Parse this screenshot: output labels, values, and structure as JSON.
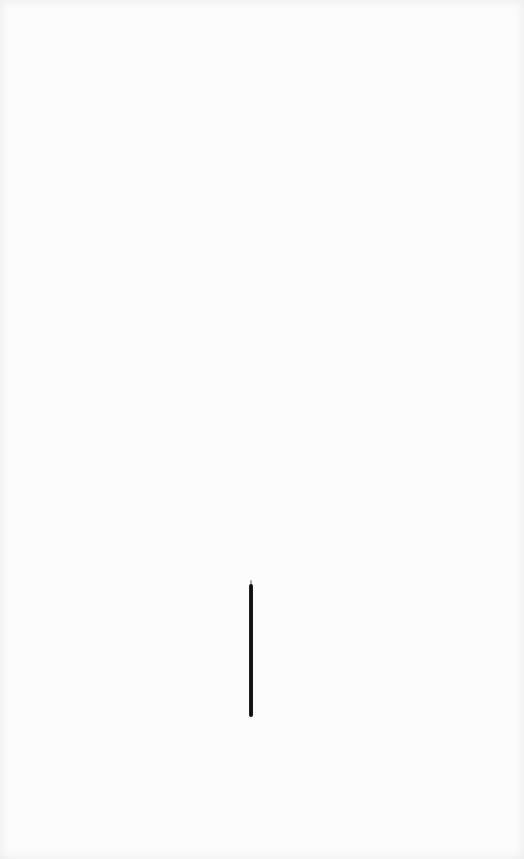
{
  "canvas": {
    "background_color": "#fcfcfc",
    "ink_color": "#111111",
    "strokes": [
      {
        "type": "vertical-line",
        "x": 251,
        "y_start": 584,
        "y_end": 717,
        "width_px": 4
      }
    ]
  }
}
